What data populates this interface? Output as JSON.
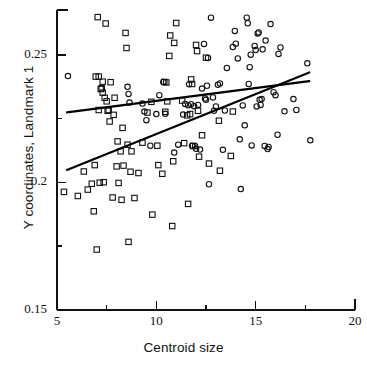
{
  "chart_data": {
    "type": "scatter",
    "title": "",
    "xlabel": "Centroid size",
    "ylabel": "Y coordinates, Landmark 1",
    "xlim": [
      5,
      20
    ],
    "ylim": [
      0.15,
      0.2676
    ],
    "grid": false,
    "legend": "none",
    "xticks": [
      5,
      10,
      15,
      20
    ],
    "xtick_labels": [
      "5",
      "10",
      "15",
      "20"
    ],
    "xminor_ticks": [
      7.5,
      12.5,
      17.5
    ],
    "yticks": [
      0.15,
      0.2,
      0.25
    ],
    "ytick_labels": [
      "0.15",
      "0.2",
      "0.25"
    ],
    "yminor_ticks": [
      0.175,
      0.225
    ],
    "series": [
      {
        "name": "squares",
        "marker": "open-square",
        "marker_size": 5.4,
        "color": "#111111",
        "points": [
          [
            5.35,
            0.1963
          ],
          [
            6.05,
            0.1947
          ],
          [
            6.35,
            0.2043
          ],
          [
            6.55,
            0.1972
          ],
          [
            6.75,
            0.1995
          ],
          [
            6.85,
            0.1887
          ],
          [
            6.9,
            0.2068
          ],
          [
            6.95,
            0.2415
          ],
          [
            7.0,
            0.1737
          ],
          [
            7.05,
            0.2648
          ],
          [
            7.1,
            0.2415
          ],
          [
            7.1,
            0.2284
          ],
          [
            7.15,
            0.1999
          ],
          [
            7.2,
            0.2366
          ],
          [
            7.25,
            0.2369
          ],
          [
            7.3,
            0.2395
          ],
          [
            7.3,
            0.2352
          ],
          [
            7.35,
            0.2001
          ],
          [
            7.4,
            0.2332
          ],
          [
            7.45,
            0.2623
          ],
          [
            7.5,
            0.2318
          ],
          [
            7.55,
            0.2281
          ],
          [
            7.6,
            0.2284
          ],
          [
            7.65,
            0.2239
          ],
          [
            7.7,
            0.2393
          ],
          [
            7.8,
            0.1941
          ],
          [
            7.85,
            0.2265
          ],
          [
            7.9,
            0.2332
          ],
          [
            8.0,
            0.2063
          ],
          [
            8.05,
            0.2161
          ],
          [
            8.1,
            0.1998
          ],
          [
            8.2,
            0.2122
          ],
          [
            8.25,
            0.1932
          ],
          [
            8.3,
            0.2214
          ],
          [
            8.35,
            0.2066
          ],
          [
            8.45,
            0.2586
          ],
          [
            8.5,
            0.2527
          ],
          [
            8.55,
            0.2148
          ],
          [
            8.6,
            0.1767
          ],
          [
            8.7,
            0.2042
          ],
          [
            8.75,
            0.2122
          ],
          [
            8.9,
            0.1939
          ],
          [
            9.1,
            0.2037
          ],
          [
            9.3,
            0.2156
          ],
          [
            9.55,
            0.2274
          ],
          [
            9.75,
            0.2316
          ],
          [
            9.8,
            0.1874
          ],
          [
            10.05,
            0.2144
          ],
          [
            10.1,
            0.2068
          ],
          [
            10.3,
            0.2034
          ],
          [
            10.4,
            0.2394
          ],
          [
            10.45,
            0.2277
          ],
          [
            10.5,
            0.2392
          ],
          [
            10.55,
            0.2318
          ],
          [
            10.65,
            0.2496
          ],
          [
            10.7,
            0.2576
          ],
          [
            10.8,
            0.1829
          ],
          [
            10.85,
            0.2083
          ],
          [
            10.9,
            0.2547
          ],
          [
            11.0,
            0.2625
          ],
          [
            11.3,
            0.2321
          ],
          [
            11.4,
            0.2154
          ],
          [
            11.55,
            0.2263
          ],
          [
            11.6,
            0.1916
          ],
          [
            11.7,
            0.2268
          ],
          [
            11.75,
            0.2404
          ],
          [
            11.8,
            0.2386
          ],
          [
            11.85,
            0.2143
          ],
          [
            12.0,
            0.2539
          ],
          [
            12.05,
            0.2515
          ],
          [
            12.1,
            0.2281
          ],
          [
            12.15,
            0.2101
          ],
          [
            12.3,
            0.2185
          ],
          [
            12.5,
            0.2489
          ],
          [
            12.65,
            0.2074
          ],
          [
            13.15,
            0.2242
          ],
          [
            13.2,
            0.2046
          ],
          [
            13.75,
            0.2104
          ],
          [
            13.85,
            0.2278
          ]
        ]
      },
      {
        "name": "circles",
        "marker": "open-circle",
        "marker_size": 5.4,
        "color": "#111111",
        "points": [
          [
            5.55,
            0.2417
          ],
          [
            8.55,
            0.2375
          ],
          [
            8.6,
            0.2347
          ],
          [
            8.65,
            0.2313
          ],
          [
            9.3,
            0.2309
          ],
          [
            9.4,
            0.2278
          ],
          [
            9.5,
            0.2244
          ],
          [
            9.7,
            0.2144
          ],
          [
            10.0,
            0.2268
          ],
          [
            10.15,
            0.2342
          ],
          [
            10.35,
            0.2394
          ],
          [
            10.45,
            0.2269
          ],
          [
            10.9,
            0.2117
          ],
          [
            11.1,
            0.2148
          ],
          [
            11.35,
            0.2266
          ],
          [
            11.45,
            0.2308
          ],
          [
            11.6,
            0.2303
          ],
          [
            11.65,
            0.2385
          ],
          [
            11.75,
            0.2307
          ],
          [
            11.8,
            0.2144
          ],
          [
            11.9,
            0.2299
          ],
          [
            11.95,
            0.2143
          ],
          [
            12.0,
            0.2132
          ],
          [
            12.1,
            0.2304
          ],
          [
            12.2,
            0.2129
          ],
          [
            12.3,
            0.2368
          ],
          [
            12.4,
            0.2543
          ],
          [
            12.45,
            0.2329
          ],
          [
            12.5,
            0.2324
          ],
          [
            12.55,
            0.2379
          ],
          [
            12.6,
            0.2488
          ],
          [
            12.65,
            0.1993
          ],
          [
            12.75,
            0.2646
          ],
          [
            12.85,
            0.2333
          ],
          [
            12.9,
            0.2281
          ],
          [
            13.0,
            0.2298
          ],
          [
            13.1,
            0.2383
          ],
          [
            13.2,
            0.2388
          ],
          [
            13.35,
            0.2128
          ],
          [
            13.45,
            0.2282
          ],
          [
            13.55,
            0.2449
          ],
          [
            13.65,
            0.2761
          ],
          [
            13.85,
            0.2531
          ],
          [
            13.95,
            0.2594
          ],
          [
            14.0,
            0.2544
          ],
          [
            14.1,
            0.2486
          ],
          [
            14.2,
            0.2169
          ],
          [
            14.25,
            0.1974
          ],
          [
            14.35,
            0.2302
          ],
          [
            14.45,
            0.2224
          ],
          [
            14.55,
            0.2646
          ],
          [
            14.6,
            0.2624
          ],
          [
            14.65,
            0.2386
          ],
          [
            14.7,
            0.2452
          ],
          [
            14.75,
            0.2501
          ],
          [
            14.8,
            0.2145
          ],
          [
            14.95,
            0.2535
          ],
          [
            15.0,
            0.2519
          ],
          [
            15.05,
            0.2298
          ],
          [
            15.1,
            0.2584
          ],
          [
            15.15,
            0.2588
          ],
          [
            15.2,
            0.2324
          ],
          [
            15.25,
            0.2304
          ],
          [
            15.3,
            0.2327
          ],
          [
            15.35,
            0.2522
          ],
          [
            15.45,
            0.2143
          ],
          [
            15.5,
            0.2556
          ],
          [
            15.6,
            0.2131
          ],
          [
            15.65,
            0.2139
          ],
          [
            15.75,
            0.2621
          ],
          [
            15.9,
            0.2354
          ],
          [
            16.0,
            0.2342
          ],
          [
            16.1,
            0.2187
          ],
          [
            16.15,
            0.2504
          ],
          [
            16.25,
            0.2529
          ],
          [
            16.45,
            0.2279
          ],
          [
            16.9,
            0.2327
          ],
          [
            17.05,
            0.2284
          ],
          [
            17.6,
            0.2467
          ],
          [
            17.75,
            0.2165
          ]
        ]
      }
    ],
    "lines": [
      {
        "name": "regression-line-squares",
        "x": [
          5.5,
          17.7
        ],
        "y": [
          0.2275,
          0.2397
        ],
        "width": 2.2,
        "color": "#000000"
      },
      {
        "name": "regression-line-circles",
        "x": [
          5.5,
          17.7
        ],
        "y": [
          0.2049,
          0.2431
        ],
        "width": 2.2,
        "color": "#000000"
      }
    ],
    "axis": {
      "color": "#111111",
      "line_width": 1.6,
      "frame": "left-bottom"
    }
  }
}
